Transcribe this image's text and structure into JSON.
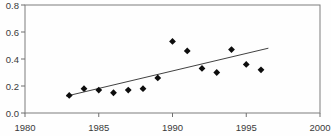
{
  "chart_data": {
    "type": "scatter",
    "title": "",
    "xlabel": "",
    "ylabel": "",
    "grid": false,
    "legend": null,
    "x": [
      1983,
      1984,
      1985,
      1986,
      1987,
      1988,
      1989,
      1990,
      1991,
      1992,
      1993,
      1994,
      1995,
      1996
    ],
    "y": [
      0.13,
      0.18,
      0.17,
      0.15,
      0.17,
      0.18,
      0.26,
      0.53,
      0.46,
      0.33,
      0.3,
      0.47,
      0.36,
      0.32
    ],
    "xlim": [
      1980,
      2000
    ],
    "ylim": [
      0,
      0.8
    ],
    "x_tick_values": [
      1980,
      1985,
      1990,
      1995,
      2000
    ],
    "x_tick_labels": [
      "1980",
      "1985",
      "1990",
      "1995",
      "2000"
    ],
    "y_tick_values": [
      0,
      0.2,
      0.4,
      0.6,
      0.8
    ],
    "y_tick_labels": [
      "0.0",
      "0.2",
      "0.4",
      "0.6",
      "0.8"
    ],
    "trend_line": {
      "x1": 1982.8,
      "y1": 0.125,
      "x2": 1996.5,
      "y2": 0.48
    },
    "marker": "diamond",
    "colors": {
      "marker": "#0d0d0d",
      "trend_line": "#2b2b2b",
      "frame": "#7d7d7d",
      "tick": "#6f6f6f",
      "tick_label": "#3a3a3a",
      "background": "#fefefe"
    }
  }
}
